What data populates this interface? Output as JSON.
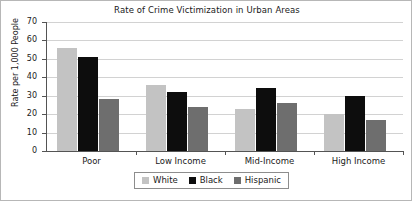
{
  "chart_data": {
    "type": "bar",
    "title": "Rate of Crime Victimization in Urban Areas",
    "xlabel": "",
    "ylabel": "Rate per 1,000 People",
    "categories": [
      "Poor",
      "Low Income",
      "Mid-Income",
      "High Income"
    ],
    "series": [
      {
        "name": "White",
        "color": "#c3c3c3",
        "values": [
          56,
          36,
          23,
          20
        ]
      },
      {
        "name": "Black",
        "color": "#0d0d0d",
        "values": [
          51,
          32,
          34,
          30
        ]
      },
      {
        "name": "Hispanic",
        "color": "#6e6e6e",
        "values": [
          28,
          24,
          26,
          17
        ]
      }
    ],
    "ylim": [
      0,
      70
    ],
    "yticks": [
      0,
      10,
      20,
      30,
      40,
      50,
      60,
      70
    ],
    "ytick_labels": [
      "0",
      "10",
      "20",
      "30",
      "40",
      "50",
      "60",
      "70"
    ],
    "grid": "horizontal",
    "legend_position": "bottom-center"
  },
  "legend": {
    "items": [
      {
        "label": "White"
      },
      {
        "label": "Black"
      },
      {
        "label": "Hispanic"
      }
    ]
  }
}
